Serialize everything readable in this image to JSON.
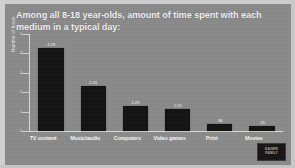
{
  "slide": {
    "title": "Among all 8-18 year-olds, amount of time spent with each medium in a typical day:",
    "background_color": "#8a8a8a",
    "bar_color": "#131313",
    "text_color": "#f4f4f4"
  },
  "watermark": {
    "line1": "KAISER",
    "line2": "FAMILY"
  },
  "chart_data": {
    "type": "bar",
    "title": "Among all 8-18 year-olds, amount of time spent with each medium in a typical day:",
    "xlabel": "",
    "ylabel": "Number of hours",
    "categories": [
      "TV content",
      "Music/audio",
      "Computers",
      "Video games",
      "Print",
      "Movies"
    ],
    "values": [
      4.29,
      2.31,
      1.29,
      1.13,
      0.38,
      0.25
    ],
    "value_labels": [
      "4.29",
      "2.31",
      "1.29",
      "1:13",
      ".38",
      ".25"
    ],
    "ylim": [
      0,
      5
    ],
    "yticks": [
      0,
      1,
      2,
      3,
      4,
      5
    ],
    "ytick_labels": [
      "0",
      "1",
      "2",
      "3",
      "4",
      "5"
    ],
    "grid": false,
    "legend": "none"
  }
}
